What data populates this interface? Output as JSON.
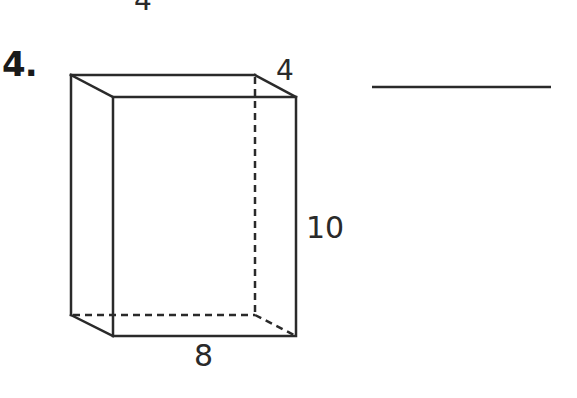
{
  "worksheet": {
    "previous_problem_fragment": "4",
    "problem": {
      "number_label": "4.",
      "shape": "rectangular prism",
      "dimensions": {
        "depth": "4",
        "height": "10",
        "width": "8"
      },
      "answer_blank": ""
    }
  },
  "colors": {
    "ink": "#2a2a2a",
    "background": "#ffffff"
  }
}
